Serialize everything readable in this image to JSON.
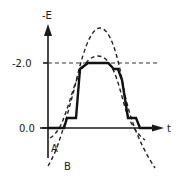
{
  "diagram": {
    "y_axis_label": "-E",
    "x_axis_label": "t",
    "y_ticks": [
      {
        "label": "-2.0",
        "level": "-2.0"
      },
      {
        "label": "0.0",
        "level": "0.0"
      }
    ],
    "curves": [
      {
        "id": "solid",
        "style": "solid",
        "description": "stepped trapezoidal pulse from 0.0 up to -2.0 and back"
      },
      {
        "id": "A",
        "label": "A",
        "style": "dashed",
        "description": "narrow bell curve peaking slightly above -2.0, dipping below 0.0 at edges"
      },
      {
        "id": "B",
        "label": "B",
        "style": "dashed",
        "description": "wide bell curve with higher peak, dipping far below 0.0 at edges"
      }
    ],
    "reference_line": {
      "level": "-2.0",
      "style": "dashed"
    }
  },
  "labels": {
    "curve_a": "A",
    "curve_b": "B",
    "y_axis": "-E",
    "x_axis": "t",
    "tick_high": "-2.0",
    "tick_zero": "0.0"
  }
}
